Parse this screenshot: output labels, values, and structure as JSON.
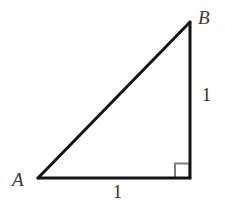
{
  "figure": {
    "kind": "right-triangle-diagram",
    "background_color": "#ffffff",
    "stroke_color": "#141414",
    "right_angle_marker_color": "#7d7d7d",
    "label_color": "#3a3a3a",
    "vertices": {
      "a": {
        "label": "A",
        "x": 38,
        "y": 178
      },
      "b": {
        "label": "B",
        "x": 190,
        "y": 22
      },
      "c": {
        "label": "",
        "x": 190,
        "y": 178
      }
    },
    "sides": [
      {
        "name": "hypotenuse",
        "from": "A",
        "to": "B",
        "label": ""
      },
      {
        "name": "vertical-leg",
        "from": "B",
        "to": "C",
        "label": "1"
      },
      {
        "name": "horizontal-leg",
        "from": "A",
        "to": "C",
        "label": "1"
      }
    ],
    "right_angle": {
      "at": "C",
      "marker": "square",
      "size": 14
    },
    "labels": {
      "vertex_a": "A",
      "vertex_b": "B",
      "leg_vertical": "1",
      "leg_horizontal": "1"
    }
  }
}
